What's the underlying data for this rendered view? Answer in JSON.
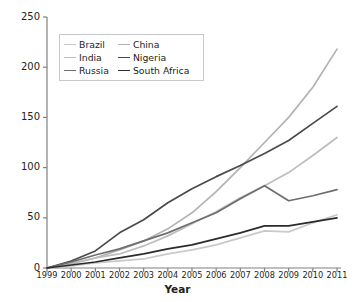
{
  "chart_data": {
    "type": "line",
    "title": "",
    "xlabel": "Year",
    "ylabel": "Percentage growth in GDP",
    "x": [
      1999,
      2000,
      2001,
      2002,
      2003,
      2004,
      2005,
      2006,
      2007,
      2008,
      2009,
      2010,
      2011
    ],
    "xtick_labels": [
      "1999",
      "2000",
      "2001",
      "2002",
      "2003",
      "2004",
      "2005",
      "2006",
      "2007",
      "2008",
      "2009",
      "2010",
      "2011"
    ],
    "ytick_labels": [
      "0",
      "50",
      "100",
      "150",
      "200",
      "250"
    ],
    "ytick_values": [
      0,
      50,
      100,
      150,
      200,
      250
    ],
    "ylim": [
      0,
      250
    ],
    "xlim": [
      1999,
      2011
    ],
    "grid": false,
    "legend_position": "upper-left",
    "series": [
      {
        "name": "Brazil",
        "color": "#c9c9c9",
        "values": [
          0,
          2,
          5,
          7,
          9,
          14,
          18,
          23,
          30,
          37,
          36,
          45,
          53
        ]
      },
      {
        "name": "China",
        "color": "#b3b3b3",
        "values": [
          0,
          4,
          10,
          18,
          27,
          39,
          55,
          76,
          100,
          125,
          150,
          180,
          218
        ]
      },
      {
        "name": "India",
        "color": "#bdbdbd",
        "values": [
          0,
          5,
          10,
          14,
          22,
          32,
          44,
          56,
          70,
          82,
          95,
          112,
          130
        ]
      },
      {
        "name": "Nigeria",
        "color": "#4a4a4a",
        "values": [
          0,
          7,
          17,
          35,
          48,
          65,
          79,
          91,
          102,
          114,
          127,
          144,
          161
        ]
      },
      {
        "name": "Russia",
        "color": "#6e6e6e",
        "values": [
          0,
          6,
          13,
          19,
          27,
          35,
          45,
          55,
          69,
          82,
          67,
          72,
          78
        ]
      },
      {
        "name": "South Africa",
        "color": "#2b2b2b",
        "values": [
          0,
          3,
          6,
          10,
          14,
          19,
          23,
          29,
          35,
          42,
          42,
          46,
          50
        ]
      }
    ]
  }
}
